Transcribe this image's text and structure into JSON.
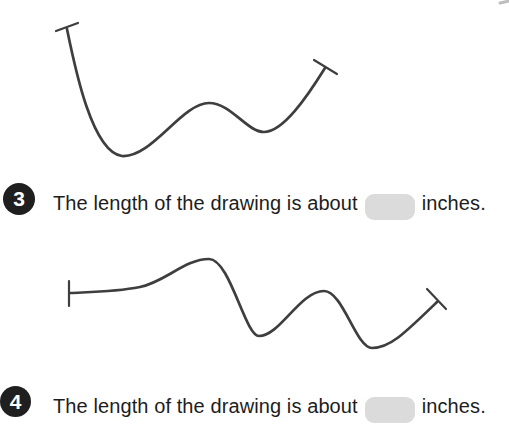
{
  "colors": {
    "line": "#3e3e3e",
    "text": "#1d1d1d",
    "badge_background": "#1f1f1f",
    "badge_text": "#ffffff",
    "blank_background": "#dbdbdb",
    "page_background": "#ffffff"
  },
  "questions": [
    {
      "number": "3",
      "text_before_blank": "The length of the drawing is about",
      "blank_value": "",
      "text_after_blank": "inches."
    },
    {
      "number": "4",
      "text_before_blank": "The length of the drawing is about",
      "blank_value": "",
      "text_after_blank": "inches."
    }
  ],
  "drawings": [
    {
      "label": "curvy line drawing for question 3",
      "path": "M 67 29 C 75 68 92 152 122 156 C 152 158 182 103 209 103 C 231 103 247 132 264 132 C 283 132 307 97 325 68",
      "ticks": "M 56 31 L 78 23 M 314 60 L 337 74"
    },
    {
      "label": "curvy line drawing for question 4",
      "path": "M 70 293 C 90 292 115 292 140 287 C 165 282 185 259 209 259 C 230 259 245 336 259 336 C 280 336 300 291 324 291 C 343 291 356 348 372 348 C 390 348 405 333 437 302",
      "ticks": "M 69 281 L 69 306 M 427 289 L 446 309"
    }
  ],
  "artifact": {
    "path": "M 500 3 L 509 1"
  }
}
